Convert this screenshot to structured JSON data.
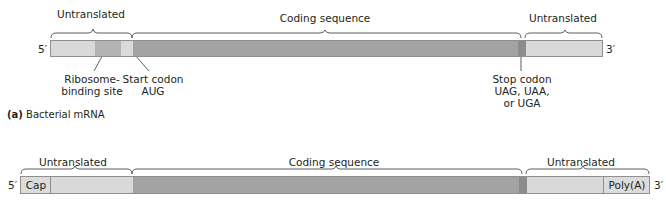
{
  "colors": {
    "untranslated": "#d9d9d9",
    "ribosome_binding_site": "#b3b3b3",
    "coding": "#a3a3a3",
    "stop_codon": "#8c8c8c",
    "cap_polya": "#dcdcdc",
    "bracket": "#4d4d4d",
    "text": "#231f20"
  },
  "bacterial": {
    "five_prime": "5′",
    "three_prime": "3′",
    "brackets": {
      "left": "Untranslated",
      "middle": "Coding sequence",
      "right": "Untranslated"
    },
    "callouts": {
      "rbs_line1": "Ribosome-",
      "rbs_line2": "binding site",
      "start_line1": "Start codon",
      "start_line2": "AUG",
      "stop_line1": "Stop codon",
      "stop_line2": "UAG, UAA,",
      "stop_line3": "or UGA"
    },
    "caption_prefix": "(a)",
    "caption_text": " Bacterial mRNA"
  },
  "eukaryotic": {
    "five_prime": "5′",
    "three_prime": "3′",
    "brackets": {
      "left": "Untranslated",
      "middle": "Coding sequence",
      "right": "Untranslated"
    },
    "cap_label": "Cap",
    "polya_label": "Poly(A)"
  }
}
